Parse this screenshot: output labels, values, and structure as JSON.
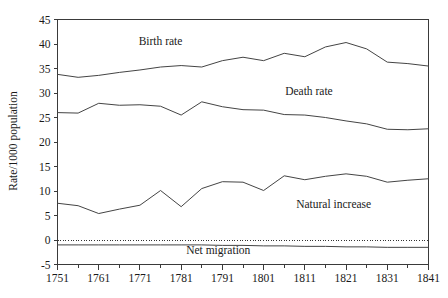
{
  "chart_data": {
    "type": "line",
    "title": "",
    "xlabel": "",
    "ylabel": "Rate/1000 population",
    "xlim": [
      1751,
      1841
    ],
    "ylim": [
      -5,
      45
    ],
    "grid": false,
    "legend_position": "inline-annotations",
    "x_tick_labels": [
      "1751",
      "1761",
      "1771",
      "1781",
      "1791",
      "1801",
      "1811",
      "1821",
      "1831",
      "1841"
    ],
    "x_ticks": [
      1751,
      1761,
      1771,
      1781,
      1791,
      1801,
      1811,
      1821,
      1831,
      1841
    ],
    "x_minor_ticks": [
      1756,
      1766,
      1776,
      1786,
      1796,
      1806,
      1816,
      1826,
      1836
    ],
    "y_tick_labels": [
      "-5",
      "0",
      "5",
      "10",
      "15",
      "20",
      "25",
      "30",
      "35",
      "40",
      "45"
    ],
    "y_ticks": [
      -5,
      0,
      5,
      10,
      15,
      20,
      25,
      30,
      35,
      40,
      45
    ],
    "x": [
      1751,
      1756,
      1761,
      1766,
      1771,
      1776,
      1781,
      1786,
      1791,
      1796,
      1801,
      1806,
      1811,
      1816,
      1821,
      1826,
      1831,
      1836,
      1841
    ],
    "reference_lines": [
      {
        "name": "zero-line",
        "value": 0,
        "style": "dotted"
      }
    ],
    "series": [
      {
        "name": "Birth rate",
        "label": "Birth rate",
        "color": "#444444",
        "values": [
          33.8,
          33.2,
          33.6,
          34.2,
          34.7,
          35.3,
          35.6,
          35.3,
          36.6,
          37.3,
          36.6,
          38.1,
          37.4,
          39.4,
          40.3,
          39.0,
          36.3,
          36.0,
          35.5
        ]
      },
      {
        "name": "Death rate",
        "label": "Death rate",
        "color": "#444444",
        "values": [
          26.0,
          25.9,
          27.9,
          27.5,
          27.6,
          27.3,
          25.5,
          28.2,
          27.2,
          26.6,
          26.5,
          25.6,
          25.5,
          25.0,
          24.3,
          23.7,
          22.6,
          22.5,
          22.7
        ]
      },
      {
        "name": "Natural increase",
        "label": "Natural increase",
        "color": "#444444",
        "values": [
          7.5,
          7.0,
          5.4,
          6.3,
          7.1,
          10.1,
          6.8,
          10.5,
          11.9,
          11.8,
          10.1,
          13.1,
          12.3,
          13.0,
          13.5,
          13.0,
          11.8,
          12.2,
          12.5
        ]
      },
      {
        "name": "Net migration",
        "label": "Net migration",
        "color": "#444444",
        "values": [
          -1.0,
          -1.0,
          -1.0,
          -1.0,
          -1.0,
          -1.0,
          -1.0,
          -1.0,
          -1.1,
          -1.1,
          -1.2,
          -1.2,
          -1.3,
          -1.3,
          -1.4,
          -1.4,
          -1.5,
          -1.5,
          -1.5
        ]
      }
    ],
    "annotations": [
      {
        "name": "birth-rate-label",
        "text": "Birth rate",
        "x": 1776,
        "y": 39.8
      },
      {
        "name": "death-rate-label",
        "text": "Death rate",
        "x": 1812,
        "y": 29.6
      },
      {
        "name": "natural-increase-label",
        "text": "Natural increase",
        "x": 1818,
        "y": 6.6
      },
      {
        "name": "net-migration-label",
        "text": "Net migration",
        "x": 1790,
        "y": -2.9
      }
    ]
  }
}
